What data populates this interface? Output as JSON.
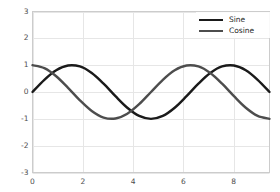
{
  "chart_data": {
    "type": "line",
    "title": "",
    "xlabel": "",
    "ylabel": "",
    "xlim": [
      0,
      9.42477796076938
    ],
    "ylim": [
      -3,
      3
    ],
    "grid": true,
    "legend_position": "upper right",
    "xticks": [
      "0",
      "2",
      "4",
      "6",
      "8"
    ],
    "xtick_values": [
      0,
      2,
      4,
      6,
      8
    ],
    "yticks": [
      "3",
      "2",
      "1",
      "0",
      "-1",
      "-2",
      "-3"
    ],
    "ytick_values": [
      3,
      2,
      1,
      0,
      -1,
      -2,
      -3
    ],
    "series": [
      {
        "name": "Sine",
        "color": "#1a1a1a",
        "linewidth": 2.4,
        "function": "sin(x)",
        "x": [
          0.0,
          0.4712,
          0.9425,
          1.4137,
          1.885,
          2.3562,
          2.8274,
          3.2987,
          3.7699,
          4.2412,
          4.7124,
          5.1836,
          5.6549,
          6.1261,
          6.5973,
          7.0686,
          7.5398,
          8.0111,
          8.4823,
          8.9535,
          9.4248
        ],
        "values": [
          0.0,
          0.454,
          0.809,
          0.988,
          0.951,
          0.707,
          0.309,
          -0.156,
          -0.588,
          -0.891,
          -1.0,
          -0.891,
          -0.588,
          -0.156,
          0.309,
          0.707,
          0.951,
          0.988,
          0.809,
          0.454,
          0.0
        ]
      },
      {
        "name": "Cosine",
        "color": "#4d4d4d",
        "linewidth": 2.4,
        "function": "cos(x)",
        "x": [
          0.0,
          0.4712,
          0.9425,
          1.4137,
          1.885,
          2.3562,
          2.8274,
          3.2987,
          3.7699,
          4.2412,
          4.7124,
          5.1836,
          5.6549,
          6.1261,
          6.5973,
          7.0686,
          7.5398,
          8.0111,
          8.4823,
          8.9535,
          9.4248
        ],
        "values": [
          1.0,
          0.891,
          0.588,
          0.156,
          -0.309,
          -0.707,
          -0.951,
          -0.988,
          -0.809,
          -0.454,
          0.0,
          0.454,
          0.809,
          0.988,
          0.951,
          0.707,
          0.309,
          -0.156,
          -0.588,
          -0.891,
          -1.0
        ]
      }
    ],
    "style": {
      "background": "#ffffff",
      "grid_color": "#e6e6e6",
      "axis_color": "#cccccc",
      "tick_label_color": "#4d4d4d"
    }
  },
  "legend": {
    "entries": [
      {
        "label": "Sine"
      },
      {
        "label": "Cosine"
      }
    ]
  }
}
